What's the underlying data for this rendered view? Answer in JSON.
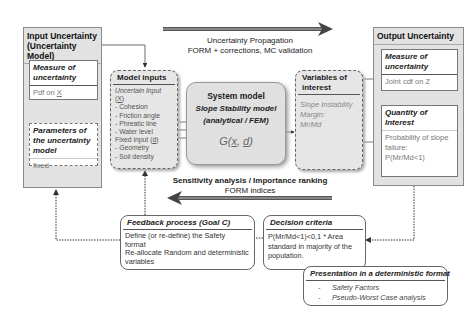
{
  "top_arrow": {
    "title": "Uncertainty Propagation",
    "subtitle": "FORM + corrections, MC validation"
  },
  "bottom_arrow": {
    "title": "Sensitivity analysis / Importance ranking",
    "subtitle": "FORM indices"
  },
  "input_uncertainty": {
    "title_line1": "Input Uncertainty",
    "title_line2": "(Uncertainty Model)",
    "measure": {
      "title_line1": "Measure of",
      "title_line2": "uncertainty",
      "body": "Pdf on ",
      "body_var": "X"
    },
    "parameters": {
      "title_line1": "Parameters of",
      "title_line2": "the uncertainty",
      "title_line3": "model",
      "body": "fixed"
    }
  },
  "model_inputs": {
    "title": "Model inputs",
    "uncertain_label": "Uncertain Input",
    "uncertain_var": "X",
    "uncertain_items": [
      "- Cohesion",
      "- Friction angle",
      "- Phreatic line",
      "- Water level"
    ],
    "fixed_label": "Fixed input (",
    "fixed_var": "d",
    "fixed_items": [
      "- Geometry",
      "- Soil density"
    ]
  },
  "system_model": {
    "title": "System model",
    "subtitle": "Slope Stability model",
    "subtitle2": "(analytical / FEM)",
    "function_prefix": "G(",
    "function_x": "x",
    "function_sep": ", ",
    "function_d": "d",
    "function_suffix": ")"
  },
  "variables_of_interest": {
    "title_line1": "Variables of",
    "title_line2": "interest",
    "body_line1": "Slope Instability",
    "body_line2": "Margin:",
    "body_line3": "Mr/Md"
  },
  "output_uncertainty": {
    "title": "Output Uncertainty",
    "measure": {
      "title_line1": "Measure of",
      "title_line2": "uncertainty",
      "body": "Joint cdf on Z"
    },
    "quantity": {
      "title_line1": "Quantity of",
      "title_line2": "Interest",
      "body_line1": "Probability of slope",
      "body_line2": "failure:",
      "body_line3": "P(Mr/Md<1)"
    }
  },
  "feedback": {
    "title": "Feedback process (Goal C)",
    "body_line1": "Define (or re-define) the Safety",
    "body_line2": "format",
    "body_line3": "Re-allocate Random and deterministic",
    "body_line4": "variables"
  },
  "decision": {
    "title": "Decision criteria",
    "body_line1": "P(Mr/Md<1)<0,1 * Area",
    "body_line2": "standard in majority of the",
    "body_line3": "population."
  },
  "presentation": {
    "title": "Presentation in a deterministic format",
    "items": [
      "Safety Factors",
      "Pseudo-Worst Case analysis"
    ],
    "bullet": "-"
  }
}
